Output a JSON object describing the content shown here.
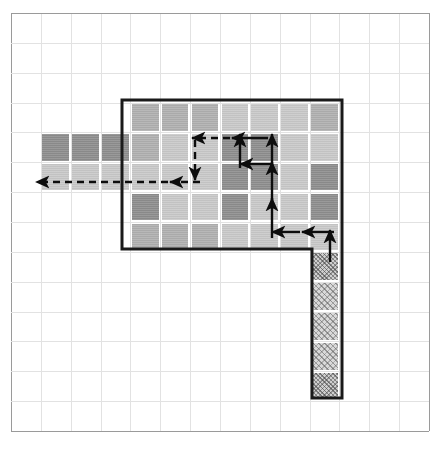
{
  "figure": {
    "width": 442,
    "height": 454,
    "background_color": "#ffffff"
  },
  "grid": {
    "name": "graph-paper-grid",
    "origin_x": 11,
    "origin_y": 13,
    "cell_size": 29.85,
    "columns": 14,
    "rows": 14,
    "line_color": "#e2e2e2",
    "edge_color": "#9a9a9a"
  },
  "palette": {
    "dark": "#8e8e8e",
    "mid": "#b0b0b0",
    "light": "#c9c9c9",
    "pale": "#d5d5d5",
    "hatch": "#d9d9d9",
    "outline": "#1a1a1a",
    "arrow": "#0d0d0d"
  },
  "legend": {
    "region_outline_label": "region boundary",
    "hatched_label": "hatched tail strip",
    "arrows_label": "scan path"
  },
  "cells": [
    {
      "name": "left-arm-dark-1",
      "col": 1,
      "row": 4,
      "tone": "dark"
    },
    {
      "name": "left-arm-dark-2",
      "col": 2,
      "row": 4,
      "tone": "dark"
    },
    {
      "name": "left-arm-dark-3",
      "col": 3,
      "row": 4,
      "tone": "dark"
    },
    {
      "name": "left-arm-light-1",
      "col": 1,
      "row": 5,
      "tone": "light"
    },
    {
      "name": "left-arm-light-2",
      "col": 2,
      "row": 5,
      "tone": "light"
    },
    {
      "name": "left-arm-light-3",
      "col": 3,
      "row": 5,
      "tone": "light"
    },
    {
      "name": "block-r3-c4",
      "col": 4,
      "row": 3,
      "tone": "mid"
    },
    {
      "name": "block-r3-c5",
      "col": 5,
      "row": 3,
      "tone": "mid"
    },
    {
      "name": "block-r3-c6",
      "col": 6,
      "row": 3,
      "tone": "mid"
    },
    {
      "name": "block-r3-c7",
      "col": 7,
      "row": 3,
      "tone": "light"
    },
    {
      "name": "block-r3-c8",
      "col": 8,
      "row": 3,
      "tone": "light"
    },
    {
      "name": "block-r3-c9",
      "col": 9,
      "row": 3,
      "tone": "light"
    },
    {
      "name": "block-r3-c10",
      "col": 10,
      "row": 3,
      "tone": "mid"
    },
    {
      "name": "block-r4-c4",
      "col": 4,
      "row": 4,
      "tone": "mid"
    },
    {
      "name": "block-r4-c5",
      "col": 5,
      "row": 4,
      "tone": "light"
    },
    {
      "name": "block-r4-c6",
      "col": 6,
      "row": 4,
      "tone": "light"
    },
    {
      "name": "block-r4-c7",
      "col": 7,
      "row": 4,
      "tone": "dark"
    },
    {
      "name": "block-r4-c8",
      "col": 8,
      "row": 4,
      "tone": "dark"
    },
    {
      "name": "block-r4-c9",
      "col": 9,
      "row": 4,
      "tone": "light"
    },
    {
      "name": "block-r4-c10",
      "col": 10,
      "row": 4,
      "tone": "light"
    },
    {
      "name": "block-r5-c4",
      "col": 4,
      "row": 5,
      "tone": "light"
    },
    {
      "name": "block-r5-c5",
      "col": 5,
      "row": 5,
      "tone": "light"
    },
    {
      "name": "block-r5-c6",
      "col": 6,
      "row": 5,
      "tone": "light"
    },
    {
      "name": "block-r5-c7",
      "col": 7,
      "row": 5,
      "tone": "dark"
    },
    {
      "name": "block-r5-c8",
      "col": 8,
      "row": 5,
      "tone": "dark"
    },
    {
      "name": "block-r5-c9",
      "col": 9,
      "row": 5,
      "tone": "light"
    },
    {
      "name": "block-r5-c10",
      "col": 10,
      "row": 5,
      "tone": "dark"
    },
    {
      "name": "block-r6-c4",
      "col": 4,
      "row": 6,
      "tone": "dark"
    },
    {
      "name": "block-r6-c5",
      "col": 5,
      "row": 6,
      "tone": "light"
    },
    {
      "name": "block-r6-c6",
      "col": 6,
      "row": 6,
      "tone": "light"
    },
    {
      "name": "block-r6-c7",
      "col": 7,
      "row": 6,
      "tone": "dark"
    },
    {
      "name": "block-r6-c8",
      "col": 8,
      "row": 6,
      "tone": "light"
    },
    {
      "name": "block-r6-c9",
      "col": 9,
      "row": 6,
      "tone": "light"
    },
    {
      "name": "block-r6-c10",
      "col": 10,
      "row": 6,
      "tone": "dark"
    },
    {
      "name": "block-r7-c4",
      "col": 4,
      "row": 7,
      "tone": "mid"
    },
    {
      "name": "block-r7-c5",
      "col": 5,
      "row": 7,
      "tone": "mid"
    },
    {
      "name": "block-r7-c6",
      "col": 6,
      "row": 7,
      "tone": "mid"
    },
    {
      "name": "block-r7-c7",
      "col": 7,
      "row": 7,
      "tone": "light"
    },
    {
      "name": "block-r7-c8",
      "col": 8,
      "row": 7,
      "tone": "light"
    },
    {
      "name": "block-r7-c9",
      "col": 9,
      "row": 7,
      "tone": "light"
    },
    {
      "name": "block-r7-c10",
      "col": 10,
      "row": 7,
      "tone": "light"
    },
    {
      "name": "tail-hatch-r8",
      "col": 10,
      "row": 8,
      "tone": "hatch-dense"
    },
    {
      "name": "tail-hatch-r9",
      "col": 10,
      "row": 9,
      "tone": "hatch"
    },
    {
      "name": "tail-hatch-r10",
      "col": 10,
      "row": 10,
      "tone": "hatch"
    },
    {
      "name": "tail-hatch-r11",
      "col": 10,
      "row": 11,
      "tone": "hatch"
    },
    {
      "name": "tail-hatch-r12",
      "col": 10,
      "row": 12,
      "tone": "hatch-dense"
    }
  ],
  "outline": {
    "name": "region-boundary-path",
    "stroke_width": 3,
    "color": "#1a1a1a",
    "points": "122,99 342,99 342,249 312,249 312,398 342,398 342,249 342,99"
  },
  "arrows": [
    {
      "name": "arrow-left-exit",
      "x1": 168,
      "y1": 182,
      "x2": 36,
      "y2": 182,
      "dashed": true,
      "dir": "left"
    },
    {
      "name": "arrow-left-mid",
      "x1": 200,
      "y1": 182,
      "x2": 170,
      "y2": 182,
      "dashed": true,
      "dir": "left"
    },
    {
      "name": "arrow-down-to-left-run",
      "x1": 195,
      "y1": 140,
      "x2": 195,
      "y2": 180,
      "dashed": true,
      "dir": "down"
    },
    {
      "name": "arrow-row4-left-a",
      "x1": 230,
      "y1": 138,
      "x2": 192,
      "y2": 138,
      "dashed": true,
      "dir": "left"
    },
    {
      "name": "arrow-row4-left-b",
      "x1": 268,
      "y1": 138,
      "x2": 232,
      "y2": 138,
      "dashed": false,
      "dir": "left"
    },
    {
      "name": "arrow-up-c7-row4",
      "x1": 240,
      "y1": 168,
      "x2": 240,
      "y2": 134,
      "dashed": false,
      "dir": "up"
    },
    {
      "name": "arrow-up-c8-row4",
      "x1": 272,
      "y1": 168,
      "x2": 272,
      "y2": 134,
      "dashed": false,
      "dir": "up"
    },
    {
      "name": "arrow-row5-left",
      "x1": 272,
      "y1": 164,
      "x2": 240,
      "y2": 164,
      "dashed": false,
      "dir": "left"
    },
    {
      "name": "arrow-up-c8-row5",
      "x1": 272,
      "y1": 200,
      "x2": 272,
      "y2": 162,
      "dashed": false,
      "dir": "up"
    },
    {
      "name": "arrow-up-c8-long",
      "x1": 272,
      "y1": 238,
      "x2": 272,
      "y2": 198,
      "dashed": false,
      "dir": "up"
    },
    {
      "name": "arrow-row7-left-a",
      "x1": 300,
      "y1": 232,
      "x2": 272,
      "y2": 232,
      "dashed": false,
      "dir": "left"
    },
    {
      "name": "arrow-row7-left-b",
      "x1": 334,
      "y1": 232,
      "x2": 302,
      "y2": 232,
      "dashed": false,
      "dir": "left"
    },
    {
      "name": "arrow-tail-up",
      "x1": 330,
      "y1": 262,
      "x2": 330,
      "y2": 230,
      "dashed": false,
      "dir": "up"
    }
  ]
}
